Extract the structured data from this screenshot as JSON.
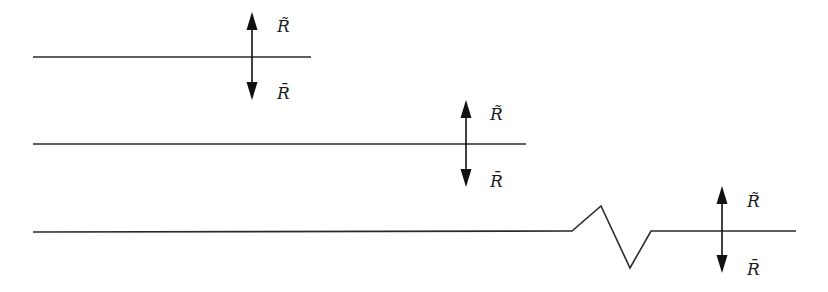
{
  "diagram": {
    "type": "surface-roughness-schematic",
    "rows": [
      {
        "id": "smooth-short",
        "line": {
          "x1": 33,
          "x2": 311,
          "y": 57
        },
        "arrow": {
          "x": 252,
          "up_tip": 12,
          "down_tip": 100
        },
        "label_up": "R̃",
        "label_down": "R̄"
      },
      {
        "id": "smooth-medium",
        "line": {
          "x1": 33,
          "x2": 526,
          "y": 144
        },
        "arrow": {
          "x": 466,
          "up_tip": 100,
          "down_tip": 187
        },
        "label_up": "R̃",
        "label_down": "R̄"
      },
      {
        "id": "with-kink",
        "line": {
          "x1": 33,
          "x2": 796,
          "y": 232
        },
        "zigzag": [
          [
            572,
            231
          ],
          [
            601,
            206
          ],
          [
            630,
            268
          ],
          [
            651,
            231
          ]
        ],
        "arrow": {
          "x": 722,
          "up_tip": 186,
          "down_tip": 273
        },
        "label_up": "R̃",
        "label_down": "R̄"
      }
    ],
    "colors": {
      "line": "#2a2a2a",
      "arrow": "#111111",
      "background": "#ffffff"
    }
  }
}
